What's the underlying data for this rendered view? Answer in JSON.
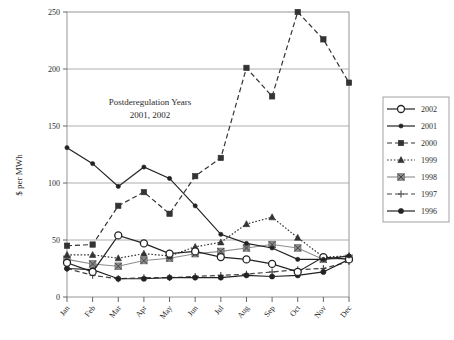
{
  "chart_data": {
    "type": "line",
    "title": "",
    "xlabel": "",
    "ylabel": "$ per MWh",
    "ylim": [
      0,
      250
    ],
    "yticks": [
      0,
      50,
      100,
      150,
      200,
      250
    ],
    "grid": true,
    "legend_position": "right",
    "categories": [
      "Jan",
      "Feb",
      "Mar",
      "Apr",
      "May",
      "Jun",
      "Jul",
      "Aug",
      "Sep",
      "Oct",
      "Nov",
      "Dec"
    ],
    "annotations": [
      {
        "text_line1": "Postderegulation Years",
        "text_line2": "2001, 2002"
      }
    ],
    "series": [
      {
        "name": "2002",
        "marker": "open-circle",
        "line": "solid",
        "color": "#222222",
        "values": [
          30,
          22,
          54,
          47,
          38,
          40,
          35,
          33,
          29,
          22,
          35,
          33
        ]
      },
      {
        "name": "2001",
        "marker": "filled-circle-small",
        "line": "solid",
        "color": "#222222",
        "values": [
          131,
          117,
          97,
          114,
          104,
          80,
          55,
          47,
          43,
          33,
          33,
          36
        ]
      },
      {
        "name": "2000",
        "marker": "filled-square",
        "line": "dashed",
        "color": "#333333",
        "values": [
          45,
          46,
          80,
          92,
          73,
          106,
          122,
          201,
          176,
          250,
          226,
          188
        ]
      },
      {
        "name": "1999",
        "marker": "filled-triangle",
        "line": "dotted",
        "color": "#333333",
        "values": [
          37,
          37,
          34,
          38,
          36,
          44,
          48,
          64,
          70,
          52,
          35,
          36
        ]
      },
      {
        "name": "1998",
        "marker": "gray-square-x",
        "line": "solid",
        "color": "#8d8d8d",
        "values": [
          33,
          29,
          27,
          32,
          34,
          38,
          40,
          43,
          46,
          43,
          33,
          34
        ]
      },
      {
        "name": "1997",
        "marker": "plus",
        "line": "dashed",
        "color": "#444444",
        "values": [
          25,
          19,
          16,
          17,
          17,
          18,
          19,
          20,
          22,
          24,
          25,
          31
        ]
      },
      {
        "name": "1996",
        "marker": "filled-circle",
        "line": "solid",
        "color": "#222222",
        "values": [
          25,
          24,
          16,
          16,
          17,
          17,
          17,
          19,
          18,
          19,
          22,
          33
        ]
      }
    ]
  },
  "legend": {
    "items": [
      {
        "label": "2002"
      },
      {
        "label": "2001"
      },
      {
        "label": "2000"
      },
      {
        "label": "1999"
      },
      {
        "label": "1998"
      },
      {
        "label": "1997"
      },
      {
        "label": "1996"
      }
    ]
  },
  "caption": {
    "text": ""
  }
}
